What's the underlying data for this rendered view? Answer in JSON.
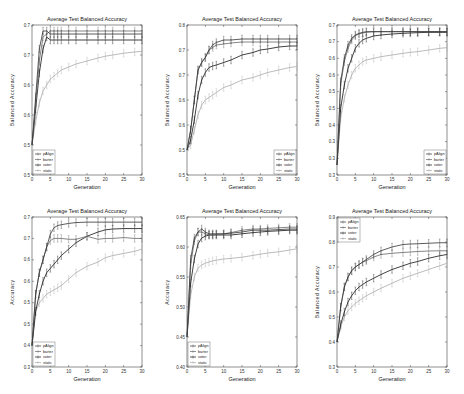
{
  "chart_data": [
    {
      "type": "line",
      "title": "Average Test Balanced Accuracy",
      "xlabel": "Generation",
      "ylabel": "Balanced Accuracy",
      "xlim": [
        0,
        30
      ],
      "ylim": [
        0.45,
        0.7
      ],
      "xticks": [
        0,
        5,
        10,
        15,
        20,
        25,
        30
      ],
      "yticks": [
        0.45,
        0.5,
        0.55,
        0.6,
        0.65,
        0.7
      ],
      "legend_position": "lower left",
      "grid": false,
      "x": [
        0,
        1,
        2,
        3,
        4,
        5,
        6,
        7,
        8,
        10,
        12,
        15,
        18,
        20,
        22,
        25,
        28,
        30
      ],
      "series": [
        {
          "name": "pAlign",
          "color": "#333333",
          "values": [
            0.5,
            0.58,
            0.66,
            0.69,
            0.69,
            0.685,
            0.685,
            0.685,
            0.685,
            0.685,
            0.685,
            0.685,
            0.685,
            0.685,
            0.685,
            0.685,
            0.685,
            0.685
          ]
        },
        {
          "name": "barter",
          "color": "#666666",
          "values": [
            0.5,
            0.57,
            0.64,
            0.68,
            0.685,
            0.69,
            0.69,
            0.69,
            0.69,
            0.69,
            0.69,
            0.69,
            0.69,
            0.69,
            0.69,
            0.69,
            0.69,
            0.69
          ]
        },
        {
          "name": "voter",
          "color": "#111111",
          "values": [
            0.5,
            0.56,
            0.62,
            0.66,
            0.68,
            0.675,
            0.675,
            0.675,
            0.675,
            0.675,
            0.675,
            0.675,
            0.675,
            0.675,
            0.675,
            0.675,
            0.675,
            0.675
          ]
        },
        {
          "name": "static",
          "color": "#aaaaaa",
          "values": [
            0.5,
            0.54,
            0.57,
            0.59,
            0.6,
            0.61,
            0.615,
            0.62,
            0.625,
            0.63,
            0.635,
            0.64,
            0.645,
            0.648,
            0.65,
            0.653,
            0.655,
            0.656
          ]
        }
      ]
    },
    {
      "type": "line",
      "title": "Average Test Balanced Accuracy",
      "xlabel": "Generation",
      "ylabel": "Balanced Accuracy",
      "xlim": [
        0,
        30
      ],
      "ylim": [
        0.45,
        0.75
      ],
      "xticks": [
        0,
        5,
        10,
        15,
        20,
        25,
        30
      ],
      "yticks": [
        0.45,
        0.5,
        0.55,
        0.6,
        0.65,
        0.7,
        0.75
      ],
      "legend_position": "lower right",
      "grid": false,
      "x": [
        0,
        1,
        2,
        3,
        4,
        5,
        6,
        7,
        8,
        10,
        12,
        15,
        18,
        20,
        22,
        25,
        28,
        30
      ],
      "series": [
        {
          "name": "pAlign",
          "color": "#333333",
          "values": [
            0.5,
            0.54,
            0.6,
            0.66,
            0.675,
            0.685,
            0.7,
            0.71,
            0.715,
            0.72,
            0.72,
            0.722,
            0.722,
            0.722,
            0.722,
            0.722,
            0.722,
            0.722
          ]
        },
        {
          "name": "barter",
          "color": "#666666",
          "values": [
            0.5,
            0.54,
            0.6,
            0.66,
            0.675,
            0.685,
            0.7,
            0.705,
            0.71,
            0.712,
            0.714,
            0.716,
            0.716,
            0.716,
            0.716,
            0.716,
            0.716,
            0.716
          ]
        },
        {
          "name": "voter",
          "color": "#111111",
          "values": [
            0.5,
            0.52,
            0.56,
            0.61,
            0.64,
            0.655,
            0.665,
            0.668,
            0.67,
            0.675,
            0.68,
            0.69,
            0.695,
            0.7,
            0.702,
            0.706,
            0.708,
            0.708
          ]
        },
        {
          "name": "static",
          "color": "#aaaaaa",
          "values": [
            0.5,
            0.51,
            0.54,
            0.57,
            0.59,
            0.6,
            0.605,
            0.61,
            0.615,
            0.625,
            0.63,
            0.64,
            0.645,
            0.65,
            0.655,
            0.66,
            0.665,
            0.667
          ]
        }
      ]
    },
    {
      "type": "line",
      "title": "Average Test Balanced Accuracy",
      "xlabel": "Generation",
      "ylabel": "Balanced Accuracy",
      "xlim": [
        0,
        30
      ],
      "ylim": [
        0.25,
        0.7
      ],
      "xticks": [
        0,
        5,
        10,
        15,
        20,
        25,
        30
      ],
      "yticks": [
        0.25,
        0.3,
        0.35,
        0.4,
        0.45,
        0.5,
        0.55,
        0.6,
        0.65,
        0.7
      ],
      "legend_position": "lower right",
      "grid": false,
      "x": [
        0,
        1,
        2,
        3,
        4,
        5,
        6,
        7,
        8,
        10,
        12,
        15,
        18,
        20,
        22,
        25,
        28,
        30
      ],
      "series": [
        {
          "name": "pAlign",
          "color": "#333333",
          "values": [
            0.28,
            0.53,
            0.6,
            0.64,
            0.66,
            0.67,
            0.675,
            0.678,
            0.68,
            0.68,
            0.68,
            0.68,
            0.68,
            0.68,
            0.68,
            0.68,
            0.68,
            0.68
          ]
        },
        {
          "name": "barter",
          "color": "#666666",
          "values": [
            0.28,
            0.52,
            0.59,
            0.63,
            0.655,
            0.668,
            0.673,
            0.676,
            0.678,
            0.68,
            0.68,
            0.68,
            0.68,
            0.68,
            0.68,
            0.68,
            0.68,
            0.68
          ]
        },
        {
          "name": "voter",
          "color": "#111111",
          "values": [
            0.28,
            0.45,
            0.52,
            0.57,
            0.6,
            0.63,
            0.645,
            0.655,
            0.66,
            0.667,
            0.67,
            0.673,
            0.675,
            0.676,
            0.677,
            0.678,
            0.678,
            0.678
          ]
        },
        {
          "name": "static",
          "color": "#aaaaaa",
          "values": [
            0.28,
            0.42,
            0.48,
            0.52,
            0.55,
            0.57,
            0.58,
            0.59,
            0.595,
            0.6,
            0.605,
            0.61,
            0.615,
            0.618,
            0.62,
            0.625,
            0.63,
            0.632
          ]
        }
      ]
    },
    {
      "type": "line",
      "title": "Average Test Balanced Accuracy",
      "xlabel": "Generation",
      "ylabel": "Accuracy",
      "xlim": [
        0,
        30
      ],
      "ylim": [
        0.35,
        0.7
      ],
      "xticks": [
        0,
        5,
        10,
        15,
        20,
        25,
        30
      ],
      "yticks": [
        0.35,
        0.4,
        0.45,
        0.5,
        0.55,
        0.6,
        0.65,
        0.7
      ],
      "legend_position": "lower left",
      "grid": false,
      "x": [
        0,
        1,
        2,
        3,
        4,
        5,
        6,
        7,
        8,
        10,
        12,
        15,
        18,
        20,
        22,
        25,
        28,
        30
      ],
      "series": [
        {
          "name": "pAlign",
          "color": "#333333",
          "values": [
            0.4,
            0.52,
            0.57,
            0.6,
            0.63,
            0.66,
            0.675,
            0.68,
            0.682,
            0.685,
            0.687,
            0.688,
            0.688,
            0.688,
            0.688,
            0.688,
            0.688,
            0.688
          ]
        },
        {
          "name": "barter",
          "color": "#666666",
          "values": [
            0.4,
            0.52,
            0.57,
            0.6,
            0.63,
            0.645,
            0.65,
            0.65,
            0.65,
            0.648,
            0.648,
            0.655,
            0.648,
            0.65,
            0.65,
            0.652,
            0.65,
            0.65
          ]
        },
        {
          "name": "voter",
          "color": "#111111",
          "values": [
            0.4,
            0.48,
            0.52,
            0.55,
            0.57,
            0.58,
            0.59,
            0.6,
            0.61,
            0.625,
            0.64,
            0.655,
            0.665,
            0.67,
            0.672,
            0.673,
            0.673,
            0.673
          ]
        },
        {
          "name": "static",
          "color": "#aaaaaa",
          "values": [
            0.4,
            0.48,
            0.5,
            0.51,
            0.52,
            0.525,
            0.53,
            0.535,
            0.54,
            0.555,
            0.57,
            0.585,
            0.595,
            0.605,
            0.61,
            0.615,
            0.62,
            0.625
          ]
        }
      ]
    },
    {
      "type": "line",
      "title": "Average Test Balanced Accuracy",
      "xlabel": "Generation",
      "ylabel": "Accuracy",
      "xlim": [
        0,
        30
      ],
      "ylim": [
        0.4,
        0.65
      ],
      "xticks": [
        0,
        5,
        10,
        15,
        20,
        25,
        30
      ],
      "yticks": [
        0.4,
        0.45,
        0.5,
        0.55,
        0.6,
        0.65
      ],
      "legend_position": "lower left",
      "grid": false,
      "x": [
        0,
        1,
        2,
        3,
        4,
        5,
        6,
        7,
        8,
        10,
        12,
        15,
        18,
        20,
        22,
        25,
        28,
        30
      ],
      "series": [
        {
          "name": "pAlign",
          "color": "#333333",
          "values": [
            0.45,
            0.58,
            0.615,
            0.625,
            0.63,
            0.625,
            0.622,
            0.622,
            0.622,
            0.622,
            0.623,
            0.625,
            0.628,
            0.628,
            0.628,
            0.629,
            0.63,
            0.63
          ]
        },
        {
          "name": "barter",
          "color": "#666666",
          "values": [
            0.45,
            0.57,
            0.61,
            0.625,
            0.625,
            0.622,
            0.62,
            0.62,
            0.621,
            0.622,
            0.624,
            0.628,
            0.63,
            0.63,
            0.631,
            0.632,
            0.633,
            0.633
          ]
        },
        {
          "name": "voter",
          "color": "#111111",
          "values": [
            0.45,
            0.54,
            0.58,
            0.605,
            0.615,
            0.618,
            0.62,
            0.62,
            0.62,
            0.62,
            0.62,
            0.622,
            0.624,
            0.625,
            0.626,
            0.627,
            0.628,
            0.628
          ]
        },
        {
          "name": "static",
          "color": "#aaaaaa",
          "values": [
            0.45,
            0.52,
            0.55,
            0.565,
            0.57,
            0.573,
            0.575,
            0.577,
            0.578,
            0.58,
            0.581,
            0.583,
            0.586,
            0.588,
            0.59,
            0.592,
            0.595,
            0.597
          ]
        }
      ]
    },
    {
      "type": "line",
      "title": "Average Test Balanced Accuracy",
      "xlabel": "Generation",
      "ylabel": "Balanced Accuracy",
      "xlim": [
        0,
        30
      ],
      "ylim": [
        0.3,
        0.9
      ],
      "xticks": [
        0,
        5,
        10,
        15,
        20,
        25,
        30
      ],
      "yticks": [
        0.3,
        0.4,
        0.5,
        0.6,
        0.7,
        0.8,
        0.9
      ],
      "legend_position": "upper left",
      "grid": false,
      "x": [
        0,
        1,
        2,
        3,
        4,
        5,
        6,
        7,
        8,
        10,
        12,
        15,
        18,
        20,
        22,
        25,
        28,
        30
      ],
      "series": [
        {
          "name": "pAlign",
          "color": "#333333",
          "values": [
            0.4,
            0.54,
            0.62,
            0.66,
            0.685,
            0.7,
            0.71,
            0.72,
            0.73,
            0.75,
            0.765,
            0.78,
            0.79,
            0.792,
            0.793,
            0.795,
            0.797,
            0.797
          ]
        },
        {
          "name": "barter",
          "color": "#666666",
          "values": [
            0.4,
            0.54,
            0.62,
            0.66,
            0.685,
            0.7,
            0.71,
            0.72,
            0.725,
            0.74,
            0.75,
            0.755,
            0.758,
            0.76,
            0.762,
            0.764,
            0.765,
            0.765
          ]
        },
        {
          "name": "voter",
          "color": "#111111",
          "values": [
            0.4,
            0.47,
            0.52,
            0.56,
            0.585,
            0.605,
            0.62,
            0.63,
            0.64,
            0.655,
            0.67,
            0.69,
            0.705,
            0.715,
            0.722,
            0.735,
            0.745,
            0.75
          ]
        },
        {
          "name": "static",
          "color": "#aaaaaa",
          "values": [
            0.4,
            0.46,
            0.5,
            0.525,
            0.54,
            0.555,
            0.565,
            0.575,
            0.585,
            0.6,
            0.615,
            0.635,
            0.655,
            0.665,
            0.675,
            0.69,
            0.705,
            0.715
          ]
        }
      ]
    }
  ]
}
